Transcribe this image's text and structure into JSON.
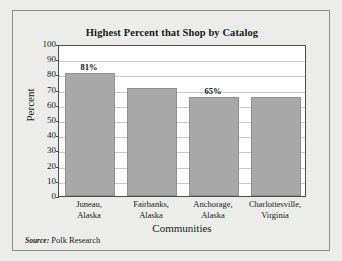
{
  "chart_data": {
    "type": "bar",
    "title": "Highest Percent that Shop by Catalog",
    "xlabel": "Communities",
    "ylabel": "Percent",
    "categories": [
      "Juneau, Alaska",
      "Fairbanks, Alaska",
      "Anchorage, Alaska",
      "Charlottesville, Virginia"
    ],
    "category_lines": [
      [
        "Juneau,",
        "Alaska"
      ],
      [
        "Fairbanks,",
        "Alaska"
      ],
      [
        "Anchorage,",
        "Alaska"
      ],
      [
        "Charlottesville,",
        "Virginia"
      ]
    ],
    "values": [
      81,
      71,
      65,
      65
    ],
    "data_labels": [
      "81%",
      "",
      "65%",
      ""
    ],
    "ylim": [
      0,
      100
    ],
    "yticks": [
      0,
      10,
      20,
      30,
      40,
      50,
      60,
      70,
      80,
      90,
      100
    ],
    "ytick_labels": [
      "0",
      "10",
      "20",
      "30",
      "40",
      "50",
      "60",
      "70",
      "80",
      "90",
      "100"
    ],
    "grid": true,
    "legend": null,
    "bar_color": "#a9a9a9",
    "plot_background": "#ffffff",
    "figure_background": "#ececeb"
  },
  "source": {
    "lead": "Source:",
    "text": " Polk Research"
  }
}
